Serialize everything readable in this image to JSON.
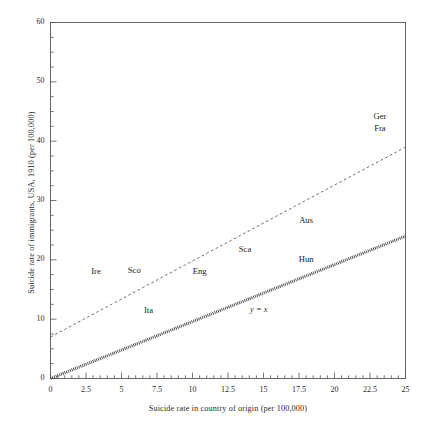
{
  "chart_data": {
    "type": "scatter",
    "title": "",
    "xlabel": "Suicide rate in country of origin (per 100,000)",
    "ylabel": "Suicide rate of immigrants, USA, 1910 (per 100,000)",
    "xlim": [
      0,
      25
    ],
    "ylim": [
      0,
      60
    ],
    "xticks": [
      0,
      2.5,
      5,
      7.5,
      10,
      12.5,
      15,
      17.5,
      20,
      22.5,
      25
    ],
    "xtick_labels": [
      "0",
      "2.5",
      "5",
      "7.5",
      "10",
      "12.5",
      "15",
      "17.5",
      "20",
      "22.5",
      "25"
    ],
    "yticks": [
      0,
      10,
      20,
      30,
      40,
      50,
      60
    ],
    "ytick_labels": [
      "0",
      "10",
      "20",
      "30",
      "40",
      "50",
      "60"
    ],
    "x_minor_tick_step": 0.5,
    "y_minor_tick_step": 2.5,
    "grid": false,
    "legend": "none",
    "points": [
      {
        "label": "Ire",
        "x": 3.2,
        "y": 18.0
      },
      {
        "label": "Sco",
        "x": 5.9,
        "y": 18.2
      },
      {
        "label": "Eng",
        "x": 10.5,
        "y": 18.0
      },
      {
        "label": "Ita",
        "x": 6.9,
        "y": 11.4
      },
      {
        "label": "Sca",
        "x": 13.7,
        "y": 21.6
      },
      {
        "label": "Aus",
        "x": 18.0,
        "y": 26.5
      },
      {
        "label": "Hun",
        "x": 18.0,
        "y": 19.9
      },
      {
        "label": "Ger",
        "x": 23.2,
        "y": 44.0
      },
      {
        "label": "Fra",
        "x": 23.2,
        "y": 42.1
      }
    ],
    "lines": [
      {
        "name": "regression",
        "style": "dashed",
        "annotation": "",
        "x": [
          0,
          25
        ],
        "y": [
          7.0,
          39.0
        ]
      },
      {
        "name": "identity",
        "style": "thick-dotted",
        "annotation": "y = x",
        "annotation_x": 14.9,
        "annotation_y": 11.4,
        "x": [
          0,
          25
        ],
        "y": [
          0,
          24.0
        ]
      }
    ],
    "colors": {
      "axis": "#555555",
      "text": "#222222",
      "regression_line": "#6b6b6b",
      "identity_line": "#444444",
      "background": "#ffffff"
    }
  }
}
